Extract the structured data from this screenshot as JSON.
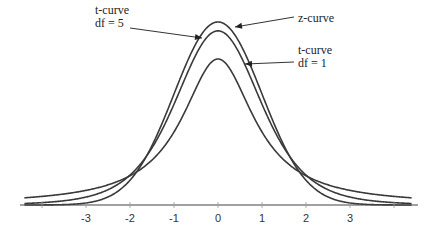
{
  "chart_data": {
    "type": "line",
    "title": "",
    "xlabel": "",
    "ylabel": "",
    "xlim": [
      -4.5,
      4.5
    ],
    "ylim": [
      0,
      0.42
    ],
    "grid": false,
    "x_ticks": [
      -4,
      -3,
      -2,
      -1,
      0,
      1,
      2,
      3,
      4
    ],
    "x_tick_labels": [
      "",
      "-3",
      "-2",
      "-1",
      "0",
      "1",
      "2",
      "3",
      ""
    ],
    "series": [
      {
        "name": "z-curve",
        "distribution": "normal",
        "df": null,
        "peak_density": 0.399
      },
      {
        "name": "t-curve df = 5",
        "distribution": "t",
        "df": 5,
        "peak_density": 0.38
      },
      {
        "name": "t-curve df = 1",
        "distribution": "t",
        "df": 1,
        "peak_density": 0.318
      }
    ],
    "annotations": [
      {
        "target": "z-curve",
        "lines": [
          "z-curve"
        ]
      },
      {
        "target": "t-curve df = 5",
        "lines": [
          "t-curve",
          "df = 5"
        ]
      },
      {
        "target": "t-curve df = 1",
        "lines": [
          "t-curve",
          "df = 1"
        ]
      }
    ],
    "line_color": "#3a3a3a"
  }
}
